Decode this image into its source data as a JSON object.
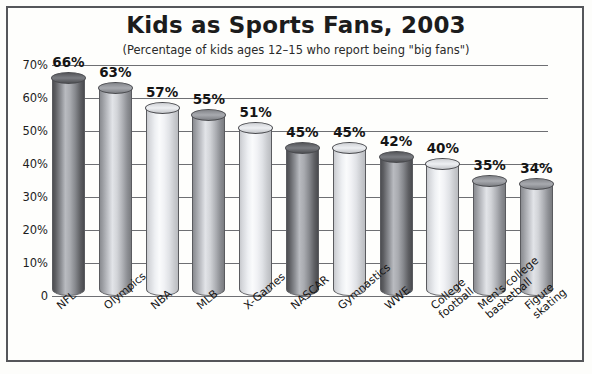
{
  "chart_data": {
    "type": "bar",
    "title": "Kids as Sports Fans, 2003",
    "subtitle": "(Percentage of kids ages 12–15 who report being \"big fans\")",
    "xlabel": "",
    "ylabel": "",
    "ylim": [
      0,
      70
    ],
    "grid": true,
    "legend": "none",
    "unit": "%",
    "categories": [
      "NFL",
      "Olympics",
      "NBA",
      "MLB",
      "X-Games",
      "NASCAR",
      "Gymnastics",
      "WWE",
      "College\nfootball",
      "Men's college\nbasketball",
      "Figure\nskating"
    ],
    "values": [
      66,
      63,
      57,
      55,
      51,
      45,
      45,
      42,
      40,
      35,
      34
    ],
    "data_labels": [
      "66%",
      "63%",
      "57%",
      "55%",
      "51%",
      "45%",
      "45%",
      "42%",
      "40%",
      "35%",
      "34%"
    ],
    "bar_shades": [
      "dark",
      "mid",
      "light",
      "mid",
      "light",
      "dark",
      "light",
      "dark",
      "light",
      "mid",
      "mid"
    ],
    "ytick_labels": [
      "70%",
      "60%",
      "50%",
      "40%",
      "30%",
      "20%",
      "10%",
      "0"
    ],
    "ytick_values": [
      70,
      60,
      50,
      40,
      30,
      20,
      10,
      0
    ]
  },
  "style": {
    "background": "#fefefc",
    "border_color": "#55565a",
    "grid_color": "#6e6f73",
    "text_color": "#151515"
  }
}
